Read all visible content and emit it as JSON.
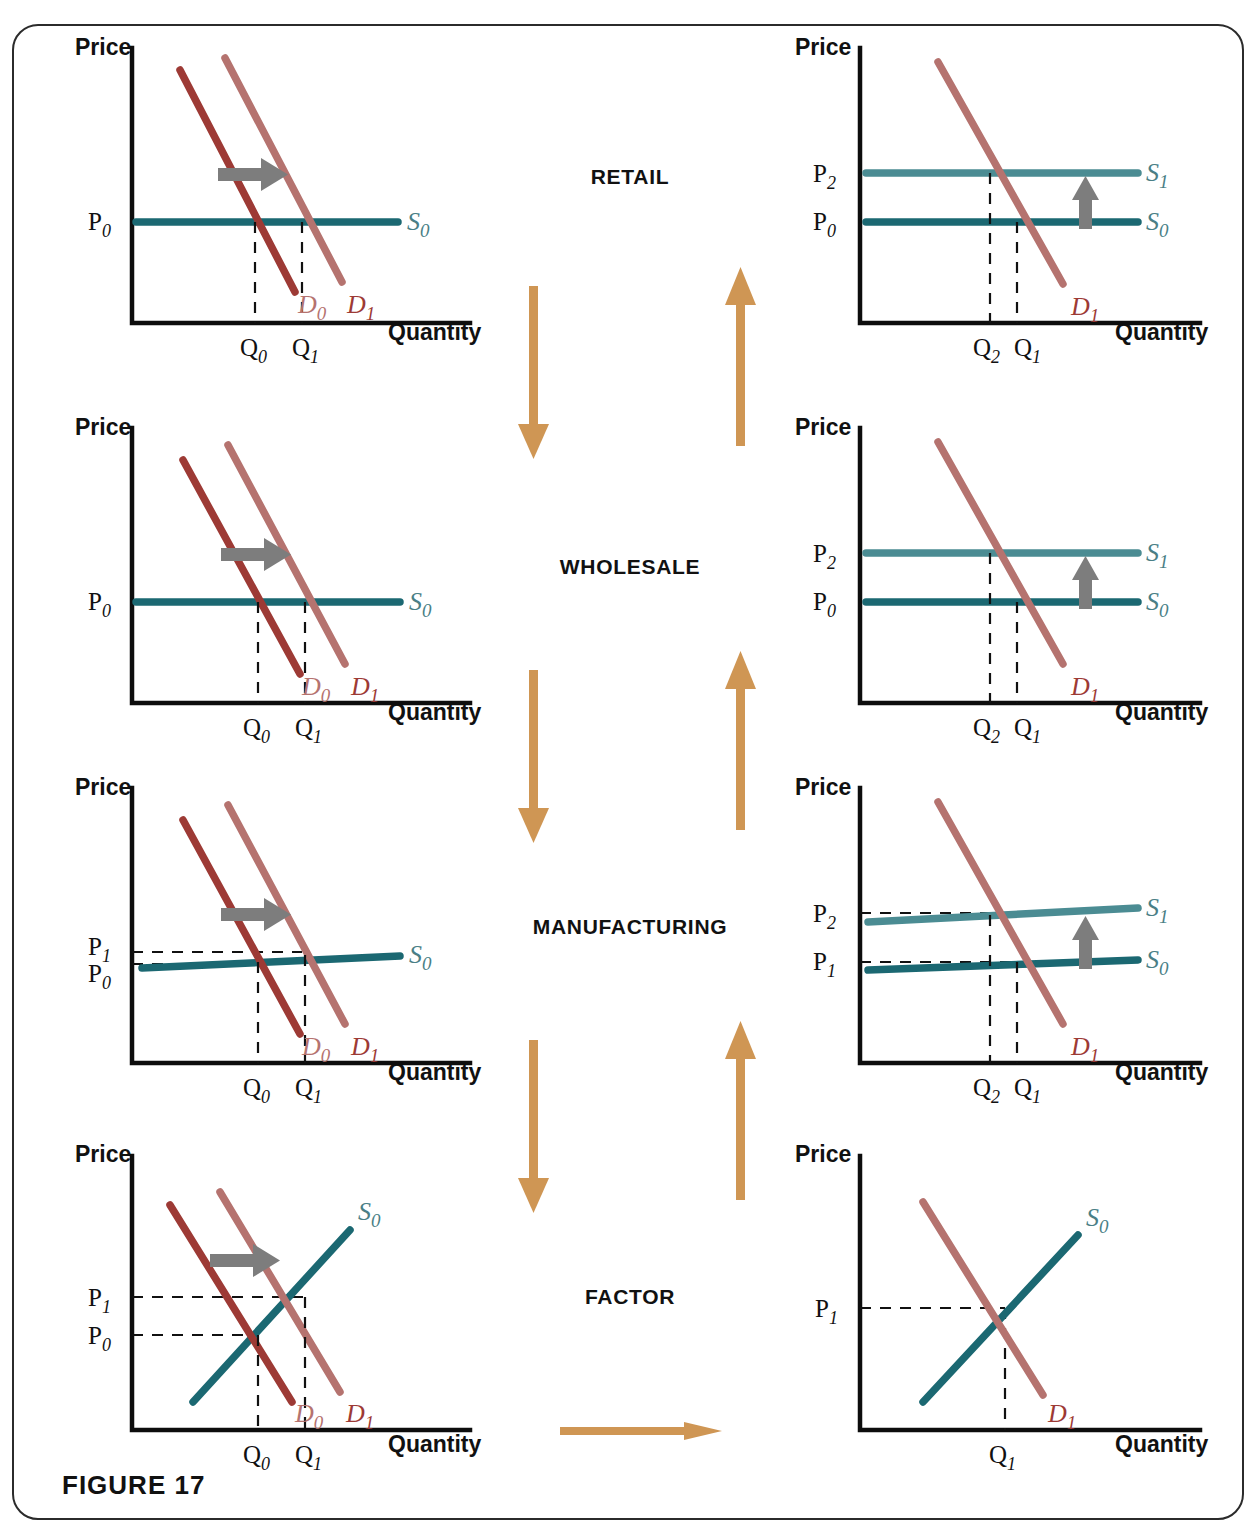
{
  "figure": {
    "caption": "FIGURE 17"
  },
  "axes": {
    "price": "Price",
    "quantity": "Quantity"
  },
  "stages": [
    {
      "name": "RETAIL",
      "label": "RETAIL"
    },
    {
      "name": "WHOLESALE",
      "label": "WHOLESALE"
    },
    {
      "name": "MANUFACTURING",
      "label": "MANUFACTURING"
    },
    {
      "name": "FACTOR",
      "label": "FACTOR"
    }
  ],
  "flow_arrows": [
    {
      "name": "down-arrow-retail-to-wholesale",
      "direction": "down"
    },
    {
      "name": "up-arrow-wholesale-to-retail",
      "direction": "up"
    },
    {
      "name": "down-arrow-wholesale-to-manufacturing",
      "direction": "down"
    },
    {
      "name": "up-arrow-manufacturing-to-wholesale",
      "direction": "up"
    },
    {
      "name": "down-arrow-manufacturing-to-factor",
      "direction": "down"
    },
    {
      "name": "up-arrow-factor-to-manufacturing",
      "direction": "up"
    },
    {
      "name": "right-arrow-factor-to-right-column",
      "direction": "right"
    }
  ],
  "colors": {
    "demand_initial": "#9d3a35",
    "demand_shifted": "#b5736f",
    "supply_initial": "#1b6872",
    "supply_shifted": "#4b8c93",
    "shift_arrow": "#7d7d7d",
    "flow_arrow": "#cf9654",
    "axis": "#0d0d0d",
    "frame": "#2b2b2b"
  },
  "panels": [
    {
      "id": "retail-left",
      "stage": "RETAIL",
      "column": "left",
      "price_ticks": [
        {
          "base": "P",
          "sub": "0"
        }
      ],
      "quantity_ticks": [
        {
          "base": "Q",
          "sub": "0"
        },
        {
          "base": "Q",
          "sub": "1"
        }
      ],
      "curves": [
        {
          "name": "demand-curve-D0",
          "label_base": "D",
          "label_sub": "0",
          "kind": "demand-old",
          "shape": "downward-sloping"
        },
        {
          "name": "demand-curve-D1",
          "label_base": "D",
          "label_sub": "1",
          "kind": "demand-new",
          "shape": "downward-sloping"
        },
        {
          "name": "supply-curve-S0",
          "label_base": "S",
          "label_sub": "0",
          "kind": "supply-old",
          "shape": "horizontal"
        }
      ],
      "shift_arrow": "rightward"
    },
    {
      "id": "retail-right",
      "stage": "RETAIL",
      "column": "right",
      "price_ticks": [
        {
          "base": "P",
          "sub": "2"
        },
        {
          "base": "P",
          "sub": "0"
        }
      ],
      "quantity_ticks": [
        {
          "base": "Q",
          "sub": "2"
        },
        {
          "base": "Q",
          "sub": "1"
        }
      ],
      "curves": [
        {
          "name": "demand-curve-D1",
          "label_base": "D",
          "label_sub": "1",
          "kind": "demand-new",
          "shape": "downward-sloping"
        },
        {
          "name": "supply-curve-S1",
          "label_base": "S",
          "label_sub": "1",
          "kind": "supply-new",
          "shape": "horizontal"
        },
        {
          "name": "supply-curve-S0",
          "label_base": "S",
          "label_sub": "0",
          "kind": "supply-old",
          "shape": "horizontal"
        }
      ],
      "shift_arrow": "upward"
    },
    {
      "id": "wholesale-left",
      "stage": "WHOLESALE",
      "column": "left",
      "price_ticks": [
        {
          "base": "P",
          "sub": "0"
        }
      ],
      "quantity_ticks": [
        {
          "base": "Q",
          "sub": "0"
        },
        {
          "base": "Q",
          "sub": "1"
        }
      ],
      "curves": [
        {
          "name": "demand-curve-D0",
          "label_base": "D",
          "label_sub": "0",
          "kind": "demand-old",
          "shape": "downward-sloping"
        },
        {
          "name": "demand-curve-D1",
          "label_base": "D",
          "label_sub": "1",
          "kind": "demand-new",
          "shape": "downward-sloping"
        },
        {
          "name": "supply-curve-S0",
          "label_base": "S",
          "label_sub": "0",
          "kind": "supply-old",
          "shape": "horizontal"
        }
      ],
      "shift_arrow": "rightward"
    },
    {
      "id": "wholesale-right",
      "stage": "WHOLESALE",
      "column": "right",
      "price_ticks": [
        {
          "base": "P",
          "sub": "2"
        },
        {
          "base": "P",
          "sub": "0"
        }
      ],
      "quantity_ticks": [
        {
          "base": "Q",
          "sub": "2"
        },
        {
          "base": "Q",
          "sub": "1"
        }
      ],
      "curves": [
        {
          "name": "demand-curve-D1",
          "label_base": "D",
          "label_sub": "1",
          "kind": "demand-new",
          "shape": "downward-sloping"
        },
        {
          "name": "supply-curve-S1",
          "label_base": "S",
          "label_sub": "1",
          "kind": "supply-new",
          "shape": "horizontal"
        },
        {
          "name": "supply-curve-S0",
          "label_base": "S",
          "label_sub": "0",
          "kind": "supply-old",
          "shape": "horizontal"
        }
      ],
      "shift_arrow": "upward"
    },
    {
      "id": "manufacturing-left",
      "stage": "MANUFACTURING",
      "column": "left",
      "price_ticks": [
        {
          "base": "P",
          "sub": "1"
        },
        {
          "base": "P",
          "sub": "0"
        }
      ],
      "quantity_ticks": [
        {
          "base": "Q",
          "sub": "0"
        },
        {
          "base": "Q",
          "sub": "1"
        }
      ],
      "curves": [
        {
          "name": "demand-curve-D0",
          "label_base": "D",
          "label_sub": "0",
          "kind": "demand-old",
          "shape": "downward-sloping"
        },
        {
          "name": "demand-curve-D1",
          "label_base": "D",
          "label_sub": "1",
          "kind": "demand-new",
          "shape": "downward-sloping"
        },
        {
          "name": "supply-curve-S0",
          "label_base": "S",
          "label_sub": "0",
          "kind": "supply-old",
          "shape": "slightly-upward-sloping"
        }
      ],
      "shift_arrow": "rightward"
    },
    {
      "id": "manufacturing-right",
      "stage": "MANUFACTURING",
      "column": "right",
      "price_ticks": [
        {
          "base": "P",
          "sub": "2"
        },
        {
          "base": "P",
          "sub": "1"
        }
      ],
      "quantity_ticks": [
        {
          "base": "Q",
          "sub": "2"
        },
        {
          "base": "Q",
          "sub": "1"
        }
      ],
      "curves": [
        {
          "name": "demand-curve-D1",
          "label_base": "D",
          "label_sub": "1",
          "kind": "demand-new",
          "shape": "downward-sloping"
        },
        {
          "name": "supply-curve-S1",
          "label_base": "S",
          "label_sub": "1",
          "kind": "supply-new",
          "shape": "slightly-upward-sloping"
        },
        {
          "name": "supply-curve-S0",
          "label_base": "S",
          "label_sub": "0",
          "kind": "supply-old",
          "shape": "slightly-upward-sloping"
        }
      ],
      "shift_arrow": "upward"
    },
    {
      "id": "factor-left",
      "stage": "FACTOR",
      "column": "left",
      "price_ticks": [
        {
          "base": "P",
          "sub": "1"
        },
        {
          "base": "P",
          "sub": "0"
        }
      ],
      "quantity_ticks": [
        {
          "base": "Q",
          "sub": "0"
        },
        {
          "base": "Q",
          "sub": "1"
        }
      ],
      "curves": [
        {
          "name": "demand-curve-D0",
          "label_base": "D",
          "label_sub": "0",
          "kind": "demand-old",
          "shape": "downward-sloping"
        },
        {
          "name": "demand-curve-D1",
          "label_base": "D",
          "label_sub": "1",
          "kind": "demand-new",
          "shape": "downward-sloping"
        },
        {
          "name": "supply-curve-S0",
          "label_base": "S",
          "label_sub": "0",
          "kind": "supply-old",
          "shape": "upward-sloping"
        }
      ],
      "shift_arrow": "rightward"
    },
    {
      "id": "factor-right",
      "stage": "FACTOR",
      "column": "right",
      "price_ticks": [
        {
          "base": "P",
          "sub": "1"
        }
      ],
      "quantity_ticks": [
        {
          "base": "Q",
          "sub": "1"
        }
      ],
      "curves": [
        {
          "name": "demand-curve-D1",
          "label_base": "D",
          "label_sub": "1",
          "kind": "demand-new",
          "shape": "downward-sloping"
        },
        {
          "name": "supply-curve-S0",
          "label_base": "S",
          "label_sub": "0",
          "kind": "supply-old",
          "shape": "upward-sloping"
        }
      ],
      "shift_arrow": "none"
    }
  ]
}
